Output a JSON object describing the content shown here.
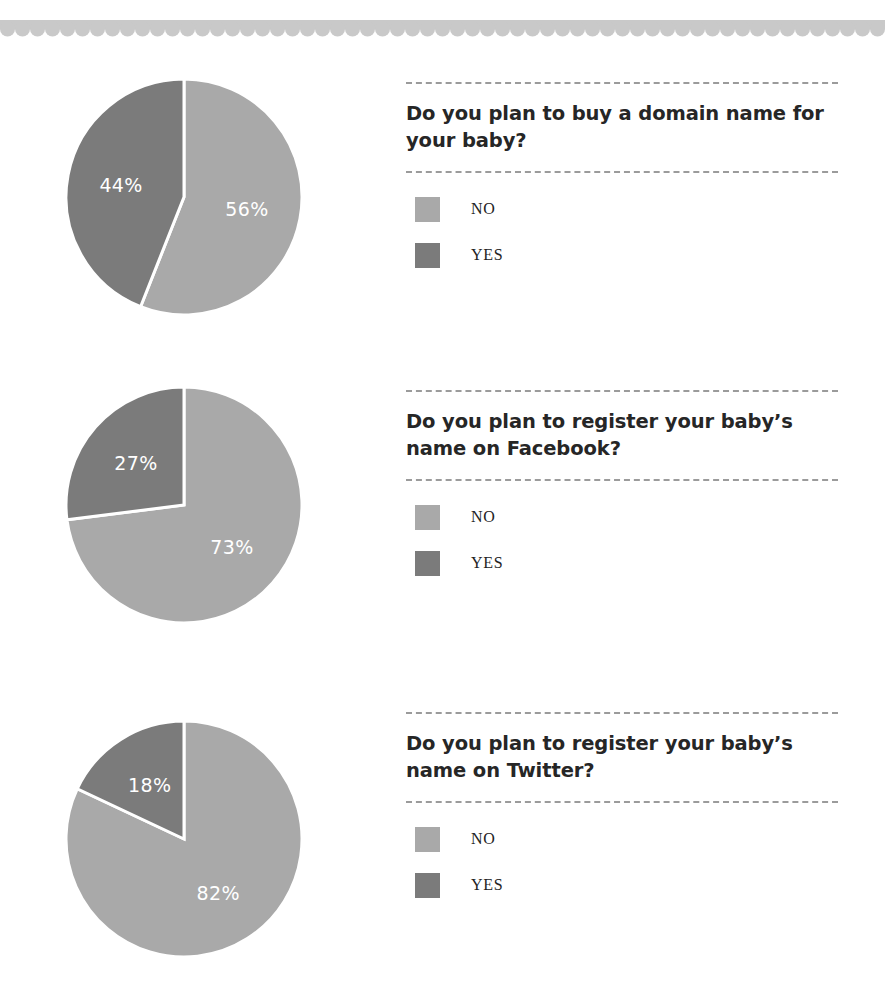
{
  "page": {
    "background": "#ffffff",
    "decor": {
      "name": "scalloped-top-border",
      "color": "#c9c9c9",
      "scallop_count": 59,
      "scallop_width": 15
    }
  },
  "palette": {
    "no_color": "#a9a9a9",
    "yes_color": "#7b7b7b",
    "label_color": "#ffffff",
    "rule_color": "#9b9b9b",
    "text_color": "#262626"
  },
  "legend_labels": {
    "no": "NO",
    "yes": "YES"
  },
  "sections": [
    {
      "question": "Do you plan to buy a domain name for your baby?",
      "legend": [
        {
          "label": "NO",
          "swatch": "no"
        },
        {
          "label": "YES",
          "swatch": "yes"
        }
      ]
    },
    {
      "question": "Do you plan to register your baby’s name on Facebook?",
      "legend": [
        {
          "label": "NO",
          "swatch": "no"
        },
        {
          "label": "YES",
          "swatch": "yes"
        }
      ]
    },
    {
      "question": "Do you plan to register your baby’s name on Twitter?",
      "legend": [
        {
          "label": "NO",
          "swatch": "no"
        },
        {
          "label": "YES",
          "swatch": "yes"
        }
      ]
    }
  ],
  "chart_data": [
    {
      "type": "pie",
      "title": "Do you plan to buy a domain name for your baby?",
      "categories": [
        "NO",
        "YES"
      ],
      "values": [
        56,
        44
      ],
      "labels": [
        "56%",
        "44%"
      ],
      "colors": [
        "#a9a9a9",
        "#7b7b7b"
      ],
      "unit": "%",
      "start_angle_deg": 0,
      "direction": "clockwise",
      "legend_position": "right"
    },
    {
      "type": "pie",
      "title": "Do you plan to register your baby’s name on Facebook?",
      "categories": [
        "NO",
        "YES"
      ],
      "values": [
        73,
        27
      ],
      "labels": [
        "73%",
        "27%"
      ],
      "colors": [
        "#a9a9a9",
        "#7b7b7b"
      ],
      "unit": "%",
      "start_angle_deg": 0,
      "direction": "clockwise",
      "legend_position": "right"
    },
    {
      "type": "pie",
      "title": "Do you plan to register your baby’s name on Twitter?",
      "categories": [
        "NO",
        "YES"
      ],
      "values": [
        82,
        18
      ],
      "labels": [
        "82%",
        "18%"
      ],
      "colors": [
        "#a9a9a9",
        "#7b7b7b"
      ],
      "unit": "%",
      "start_angle_deg": 0,
      "direction": "clockwise",
      "legend_position": "right"
    }
  ]
}
